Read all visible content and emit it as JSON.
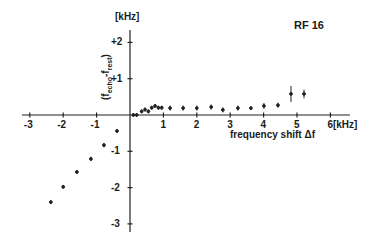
{
  "chart_data": {
    "type": "scatter",
    "title": "RF 16",
    "xlabel": "frequency shift Δf",
    "x_unit": "[kHz]",
    "ylabel": "(f_echo - f_rest)",
    "y_unit": "[kHz]",
    "xlim": [
      -3,
      6
    ],
    "ylim": [
      -3,
      2.2
    ],
    "x_ticks": [
      -3,
      -2,
      -1,
      1,
      2,
      3,
      4,
      5,
      6
    ],
    "x_tick_labels": [
      "-3",
      "-2",
      "-1",
      "1",
      "2",
      "3",
      "4",
      "5",
      "6"
    ],
    "y_ticks": [
      2,
      1,
      -1,
      -2,
      -3
    ],
    "y_tick_labels": [
      "+2",
      "+1",
      "-1",
      "-2",
      "-3"
    ],
    "grid": false,
    "series": [
      {
        "name": "RF 16",
        "points": [
          {
            "x": -2.37,
            "y": -2.4,
            "err": 0.05
          },
          {
            "x": -2.0,
            "y": -1.98,
            "err": 0.05
          },
          {
            "x": -1.59,
            "y": -1.57,
            "err": 0.05
          },
          {
            "x": -1.17,
            "y": -1.21,
            "err": 0.06
          },
          {
            "x": -0.78,
            "y": -0.83,
            "err": 0.06
          },
          {
            "x": -0.39,
            "y": -0.44,
            "err": 0.04
          },
          {
            "x": 0.1,
            "y": 0.0,
            "err": 0.02
          },
          {
            "x": 0.2,
            "y": 0.0,
            "err": 0.02
          },
          {
            "x": 0.35,
            "y": 0.1,
            "err": 0.03
          },
          {
            "x": 0.45,
            "y": 0.15,
            "err": 0.04
          },
          {
            "x": 0.55,
            "y": 0.1,
            "err": 0.03
          },
          {
            "x": 0.65,
            "y": 0.2,
            "err": 0.05
          },
          {
            "x": 0.75,
            "y": 0.25,
            "err": 0.05
          },
          {
            "x": 0.85,
            "y": 0.2,
            "err": 0.05
          },
          {
            "x": 0.95,
            "y": 0.2,
            "err": 0.05
          },
          {
            "x": 1.2,
            "y": 0.19,
            "err": 0.07
          },
          {
            "x": 1.59,
            "y": 0.19,
            "err": 0.07
          },
          {
            "x": 2.0,
            "y": 0.19,
            "err": 0.07
          },
          {
            "x": 2.43,
            "y": 0.22,
            "err": 0.07
          },
          {
            "x": 2.78,
            "y": 0.14,
            "err": 0.07
          },
          {
            "x": 3.23,
            "y": 0.19,
            "err": 0.07
          },
          {
            "x": 3.62,
            "y": 0.19,
            "err": 0.05
          },
          {
            "x": 4.01,
            "y": 0.25,
            "err": 0.08
          },
          {
            "x": 4.43,
            "y": 0.27,
            "err": 0.07
          },
          {
            "x": 4.82,
            "y": 0.58,
            "err": 0.22
          },
          {
            "x": 5.21,
            "y": 0.58,
            "err": 0.12
          }
        ]
      }
    ],
    "annotations": [
      "RF 16"
    ]
  },
  "labels": {
    "panel_id": "RF 16",
    "y_unit": "[kHz]",
    "x_unit": "6[kHz]",
    "xlabel": "frequency shift Δf",
    "ylabel_main": "(f",
    "ylabel_sub1": "echo",
    "ylabel_mid": "-f",
    "ylabel_sub2": "rest",
    "ylabel_end": ")"
  }
}
